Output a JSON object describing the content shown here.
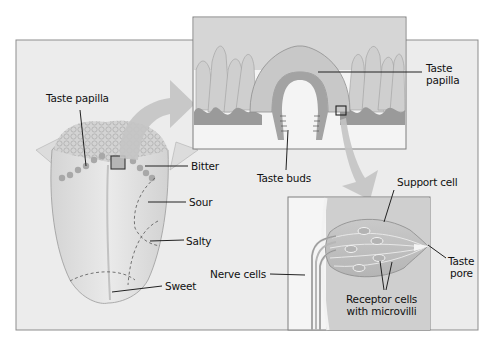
{
  "figure": {
    "colors": {
      "panel_bg": "#ececec",
      "panel_border": "#8a8a8a",
      "tongue": "#e4e4e4",
      "papilla_tissue": "#bdbdbd",
      "arrow": "#c4c4c4",
      "text": "#111111",
      "leader_line": "#222222"
    }
  },
  "tongue_panel": {
    "labels": {
      "taste_papilla": "Taste papilla",
      "bitter": "Bitter",
      "sour": "Sour",
      "salty": "Salty",
      "sweet": "Sweet"
    }
  },
  "papilla_inset": {
    "labels": {
      "taste_papilla_line1": "Taste",
      "taste_papilla_line2": "papilla",
      "taste_buds": "Taste buds"
    }
  },
  "taste_bud_inset": {
    "labels": {
      "support_cell": "Support cell",
      "taste_pore_line1": "Taste",
      "taste_pore_line2": "pore",
      "nerve_cells": "Nerve cells",
      "receptor_cells_line1": "Receptor cells",
      "receptor_cells_line2": "with microvilli"
    }
  }
}
